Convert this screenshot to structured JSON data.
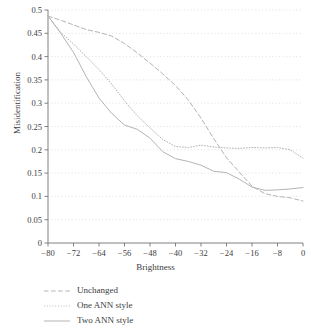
{
  "chart_data": {
    "type": "line",
    "title": "",
    "xlabel": "Brightness",
    "ylabel": "Misidentification",
    "xlim": [
      -80,
      0
    ],
    "ylim": [
      0,
      0.5
    ],
    "xticks": [
      -80,
      -72,
      -64,
      -56,
      -48,
      -40,
      -32,
      -24,
      -16,
      -8,
      0
    ],
    "xtick_labels": [
      "−80",
      "−72",
      "−64",
      "−56",
      "−48",
      "−40",
      "−32",
      "−24",
      "−16",
      "−8",
      "0"
    ],
    "yticks": [
      0,
      0.05,
      0.1,
      0.15,
      0.2,
      0.25,
      0.3,
      0.35,
      0.4,
      0.45,
      0.5
    ],
    "ytick_labels": [
      "0",
      "0.05",
      "0.1",
      "0.15",
      "0.2",
      "0.25",
      "0.3",
      "0.35",
      "0.4",
      "0.45",
      "0.5"
    ],
    "grid": "horizontal-dotted",
    "legend_position": "below-axes-left",
    "line_color": "#b4b4b4",
    "axis_color": "#808080",
    "grid_color": "#c8c8c8",
    "series": [
      {
        "name": "Unchanged",
        "style": "dashed",
        "x": [
          -80,
          -76,
          -72,
          -68,
          -64,
          -60,
          -56,
          -52,
          -48,
          -44,
          -40,
          -36,
          -32,
          -28,
          -24,
          -20,
          -16,
          -12,
          -8,
          -4,
          0
        ],
        "values": [
          0.487,
          0.478,
          0.468,
          0.458,
          0.452,
          0.444,
          0.428,
          0.408,
          0.386,
          0.363,
          0.338,
          0.307,
          0.268,
          0.224,
          0.183,
          0.152,
          0.122,
          0.106,
          0.1,
          0.097,
          0.09
        ]
      },
      {
        "name": "One ANN style",
        "style": "dotted",
        "x": [
          -80,
          -76,
          -72,
          -68,
          -64,
          -60,
          -56,
          -52,
          -48,
          -44,
          -40,
          -36,
          -32,
          -28,
          -24,
          -20,
          -16,
          -12,
          -8,
          -4,
          0
        ],
        "values": [
          0.487,
          0.452,
          0.427,
          0.4,
          0.372,
          0.341,
          0.305,
          0.273,
          0.247,
          0.222,
          0.207,
          0.205,
          0.21,
          0.206,
          0.204,
          0.203,
          0.205,
          0.204,
          0.205,
          0.2,
          0.182
        ]
      },
      {
        "name": "Two ANN style",
        "style": "solid",
        "x": [
          -80,
          -76,
          -72,
          -68,
          -64,
          -60,
          -56,
          -52,
          -48,
          -44,
          -40,
          -36,
          -32,
          -28,
          -24,
          -20,
          -16,
          -12,
          -8,
          -4,
          0
        ],
        "values": [
          0.487,
          0.45,
          0.409,
          0.357,
          0.311,
          0.278,
          0.253,
          0.244,
          0.225,
          0.196,
          0.181,
          0.175,
          0.167,
          0.154,
          0.151,
          0.137,
          0.12,
          0.113,
          0.114,
          0.116,
          0.119
        ]
      }
    ]
  },
  "legend": {
    "items": [
      {
        "label": "Unchanged",
        "style": "dashed"
      },
      {
        "label": "One ANN style",
        "style": "dotted"
      },
      {
        "label": "Two ANN style",
        "style": "solid"
      }
    ]
  }
}
